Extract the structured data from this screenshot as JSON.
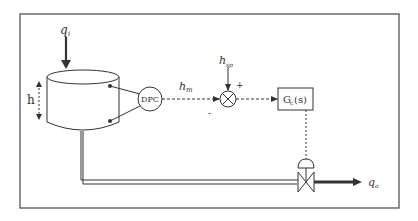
{
  "diagram": {
    "labels": {
      "inflow": "q",
      "inflow_sub": "i",
      "level": "h",
      "sensor": "DPC",
      "measured": "h",
      "measured_sub": "m",
      "setpoint": "h",
      "setpoint_sub": "sp",
      "plus": "+",
      "minus": "-",
      "controller": "G",
      "controller_sub": "c",
      "controller_arg": "(s)",
      "outflow": "q",
      "outflow_sub": "o"
    },
    "colors": {
      "line": "#333333",
      "frame": "#555555"
    }
  }
}
